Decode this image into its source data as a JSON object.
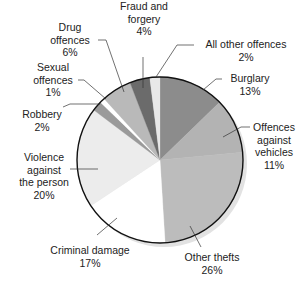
{
  "chart_data": {
    "type": "pie",
    "title": "",
    "start_angle_deg": 0,
    "direction": "clockwise",
    "slices": [
      {
        "label": "Burglary",
        "value": 13,
        "pct_label": "13%",
        "color": "#8c8c8c"
      },
      {
        "label": "Offences against vehicles",
        "value": 11,
        "pct_label": "11%",
        "color": "#b3b3b3"
      },
      {
        "label": "Other thefts",
        "value": 26,
        "pct_label": "26%",
        "color": "#bcbcbc"
      },
      {
        "label": "Criminal damage",
        "value": 17,
        "pct_label": "17%",
        "color": "#ffffff"
      },
      {
        "label": "Violence against the person",
        "value": 20,
        "pct_label": "20%",
        "color": "#ececec"
      },
      {
        "label": "Robbery",
        "value": 2,
        "pct_label": "2%",
        "color": "#9a9a9a"
      },
      {
        "label": "Sexual offences",
        "value": 1,
        "pct_label": "1%",
        "color": "#ffffff"
      },
      {
        "label": "Drug offences",
        "value": 6,
        "pct_label": "6%",
        "color": "#b9b9b9"
      },
      {
        "label": "Fraud and forgery",
        "value": 4,
        "pct_label": "4%",
        "color": "#6b6b6b"
      },
      {
        "label": "All other offences",
        "value": 2,
        "pct_label": "2%",
        "color": "#e8e8e8"
      }
    ],
    "legend": "none (direct labels with leader lines)"
  },
  "labels": {
    "drug": {
      "line1": "Drug",
      "line2": "offences",
      "pct": "6%"
    },
    "fraud": {
      "line1": "Fraud and",
      "line2": "forgery",
      "pct": "4%"
    },
    "allother": {
      "line1": "All other offences",
      "pct": "2%"
    },
    "sexual": {
      "line1": "Sexual",
      "line2": "offences",
      "pct": "1%"
    },
    "burglary": {
      "line1": "Burglary",
      "pct": "13%"
    },
    "robbery": {
      "line1": "Robbery",
      "pct": "2%"
    },
    "vehicles": {
      "line1": "Offences",
      "line2": "against",
      "line3": "vehicles",
      "pct": "11%"
    },
    "violence": {
      "line1": "Violence",
      "line2": "against",
      "line3": "the person",
      "pct": "20%"
    },
    "criminal": {
      "line1": "Criminal damage",
      "pct": "17%"
    },
    "thefts": {
      "line1": "Other thefts",
      "pct": "26%"
    }
  }
}
